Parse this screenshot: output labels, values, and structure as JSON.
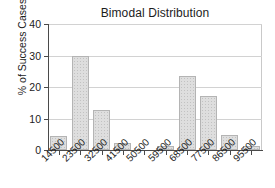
{
  "chart_data": {
    "type": "bar",
    "title": "Bimodal Distribution",
    "xlabel": "",
    "ylabel": "% of Success Cases",
    "categories": [
      "14500",
      "23500",
      "32500",
      "41500",
      "50500",
      "59500",
      "68500",
      "77500",
      "86500",
      "95500"
    ],
    "values": [
      4.3,
      30.0,
      12.6,
      2.3,
      0.0,
      1.3,
      23.5,
      17.3,
      4.9,
      1.4
    ],
    "ylim": [
      0,
      40
    ],
    "yticks": [
      0,
      10,
      20,
      30,
      40
    ],
    "ytick_labels": [
      "0",
      "10",
      "20",
      "30",
      "40"
    ],
    "grid": true,
    "legend": "none",
    "bar_color": "#dedede",
    "bar_edge_color": "#b4b4b4",
    "axis_color": "#4a4a4a",
    "grid_color": "#d2d2d2",
    "background": "#ffffff"
  }
}
